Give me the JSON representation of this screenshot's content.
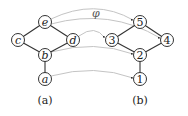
{
  "diagram": {
    "map_label": "φ",
    "graph_a": {
      "caption": "(a)",
      "nodes": [
        {
          "id": "e",
          "label": "e",
          "x": 45,
          "y": 22
        },
        {
          "id": "c",
          "label": "c",
          "x": 18,
          "y": 40
        },
        {
          "id": "d",
          "label": "d",
          "x": 73,
          "y": 40
        },
        {
          "id": "b",
          "label": "b",
          "x": 45,
          "y": 55
        },
        {
          "id": "a",
          "label": "a",
          "x": 45,
          "y": 79
        }
      ],
      "edges": [
        [
          "e",
          "c"
        ],
        [
          "e",
          "d"
        ],
        [
          "c",
          "b"
        ],
        [
          "d",
          "b"
        ],
        [
          "b",
          "a"
        ]
      ]
    },
    "graph_b": {
      "caption": "(b)",
      "nodes": [
        {
          "id": "5",
          "label": "5",
          "x": 140,
          "y": 22
        },
        {
          "id": "3",
          "label": "3",
          "x": 112,
          "y": 40
        },
        {
          "id": "4",
          "label": "4",
          "x": 167,
          "y": 40
        },
        {
          "id": "2",
          "label": "2",
          "x": 140,
          "y": 55
        },
        {
          "id": "1",
          "label": "1",
          "x": 140,
          "y": 79
        }
      ],
      "edges": [
        [
          "5",
          "3"
        ],
        [
          "5",
          "4"
        ],
        [
          "3",
          "2"
        ],
        [
          "4",
          "2"
        ],
        [
          "2",
          "1"
        ]
      ]
    },
    "mapping": [
      {
        "from": "e",
        "to": "5"
      },
      {
        "from": "e",
        "to": "4"
      },
      {
        "from": "d",
        "to": "3"
      },
      {
        "from": "b",
        "to": "2"
      },
      {
        "from": "a",
        "to": "1"
      }
    ],
    "colors": {
      "node_stroke": "#333333",
      "edge": "#333333",
      "map_arrow": "#bdbdbd"
    }
  }
}
